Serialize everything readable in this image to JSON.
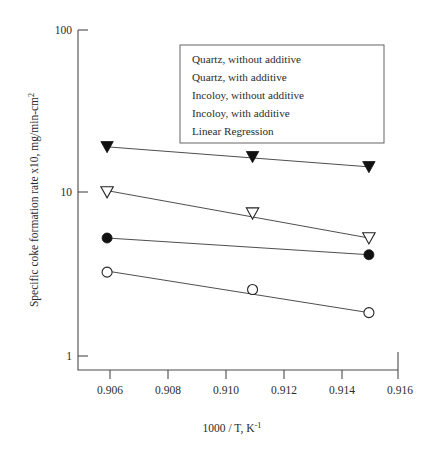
{
  "chart_data": {
    "type": "scatter",
    "title": "",
    "xlabel": "1000 / T, K-1",
    "xlabel_main": "1000 / T, K",
    "xlabel_sup": "-1",
    "ylabel_main": "Specific coke formation rate x10, mg/min-cm",
    "ylabel_sup": "2",
    "ylabel": "Specific coke formation rate x10, mg/min-cm2",
    "xlim": [
      0.905,
      0.916
    ],
    "ylim": [
      1,
      100
    ],
    "yscale": "log",
    "grid": false,
    "legend_position": "upper-center-right",
    "xticks": [
      "0.906",
      "0.908",
      "0.910",
      "0.912",
      "0.914",
      "0.916"
    ],
    "xtick_values": [
      0.906,
      0.908,
      0.91,
      0.912,
      0.914,
      0.916
    ],
    "yticks": [
      "100",
      "10",
      "1"
    ],
    "ytick_values": [
      100,
      10,
      1
    ],
    "series": [
      {
        "name": "Quartz, without additive",
        "marker": "filled-triangle-down",
        "x": [
          0.906,
          0.911,
          0.915
        ],
        "values": [
          19.0,
          16.5,
          14.3
        ],
        "fit_x": [
          0.906,
          0.915
        ],
        "fit_y": [
          19.0,
          14.3
        ]
      },
      {
        "name": "Quartz, with additive",
        "marker": "open-triangle-down",
        "x": [
          0.906,
          0.911,
          0.915
        ],
        "values": [
          10.0,
          7.4,
          5.2
        ],
        "fit_x": [
          0.906,
          0.915
        ],
        "fit_y": [
          10.2,
          5.2
        ]
      },
      {
        "name": "Incoloy, without additive",
        "marker": "filled-circle",
        "x": [
          0.906,
          0.915
        ],
        "values": [
          5.2,
          4.1
        ],
        "fit_x": [
          0.906,
          0.915
        ],
        "fit_y": [
          5.2,
          4.1
        ]
      },
      {
        "name": "Incoloy, with additive",
        "marker": "open-circle",
        "x": [
          0.906,
          0.911,
          0.915
        ],
        "values": [
          3.2,
          2.5,
          1.8
        ],
        "fit_x": [
          0.906,
          0.915
        ],
        "fit_y": [
          3.25,
          1.8
        ]
      }
    ],
    "legend_entries": [
      "Quartz, without additive",
      "Quartz, with additive",
      "Incoloy, without additive",
      "Incoloy, with additive",
      "Linear Regression"
    ]
  },
  "colors": {
    "axis": "#4a4a4a",
    "line": "#3a3a3a",
    "marker_fill": "#111111",
    "marker_open_fill": "#ffffff",
    "text": "#2b2b2b",
    "background": "#ffffff"
  }
}
